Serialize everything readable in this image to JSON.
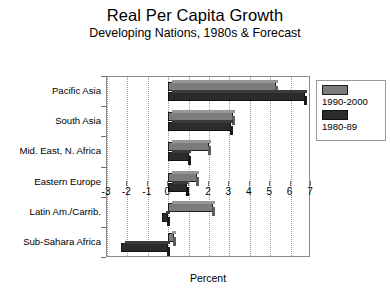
{
  "chart_data": {
    "type": "bar",
    "orientation": "horizontal",
    "title": "Real Per Capita Growth",
    "subtitle": "Developing Nations, 1980s & Forecast",
    "xlabel": "Percent",
    "ylabel": "",
    "xlim": [
      -3,
      7
    ],
    "xticks": [
      "-3",
      "-2",
      "-1",
      "0",
      "1",
      "2",
      "3",
      "4",
      "5",
      "6",
      "7"
    ],
    "grid": true,
    "grid_axis": "x",
    "legend_position": "right",
    "categories": [
      "Pacific Asia",
      "South Asia",
      "Mid. East, N. Africa",
      "Eastern Europe",
      "Latin Am./Carrib.",
      "Sub-Sahara Africa"
    ],
    "series": [
      {
        "name": "1990-2000",
        "color": "#7c7c7c",
        "values": [
          5.3,
          3.2,
          2.0,
          1.4,
          2.2,
          0.3
        ]
      },
      {
        "name": "1980-89",
        "color": "#2b2b2b",
        "values": [
          6.7,
          3.1,
          1.0,
          0.9,
          -0.3,
          -2.3
        ]
      }
    ]
  },
  "legend": {
    "entries": [
      {
        "label": "1990-2000"
      },
      {
        "label": "1980-89"
      }
    ]
  }
}
